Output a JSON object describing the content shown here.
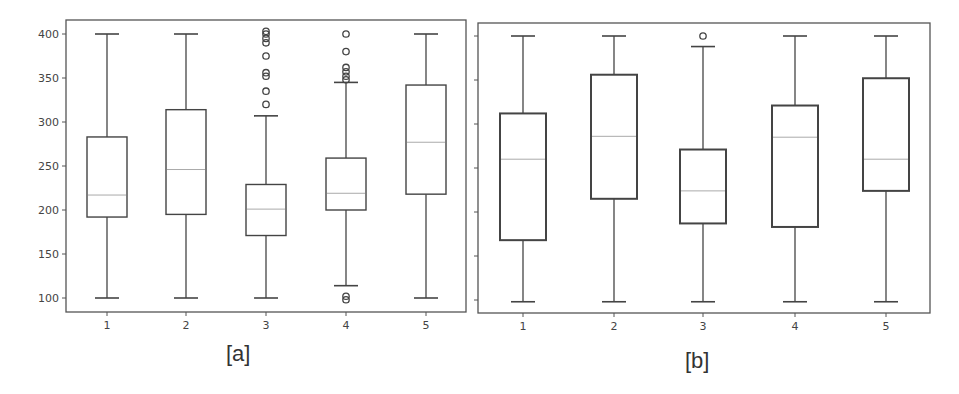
{
  "figure": {
    "panels": [
      {
        "id": "a",
        "label": "[a]"
      },
      {
        "id": "b",
        "label": "[b]"
      }
    ]
  },
  "style": {
    "frame_color": "#555555",
    "box_color": "#444444",
    "median_color": "#aaaaaa",
    "tick_label_color": "#444444"
  },
  "chart_data": [
    {
      "type": "boxplot",
      "title": "",
      "panel_label": "[a]",
      "xlabel": "",
      "ylabel": "",
      "categories": [
        "1",
        "2",
        "3",
        "4",
        "5"
      ],
      "yticks": [
        100,
        150,
        200,
        250,
        300,
        350,
        400
      ],
      "ylim": [
        85,
        415
      ],
      "grid": false,
      "boxes": [
        {
          "q1": 192,
          "median": 217,
          "q3": 283,
          "whisker_low": 100,
          "whisker_high": 400,
          "outliers": []
        },
        {
          "q1": 195,
          "median": 246,
          "q3": 314,
          "whisker_low": 100,
          "whisker_high": 400,
          "outliers": []
        },
        {
          "q1": 171,
          "median": 201,
          "q3": 229,
          "whisker_low": 100,
          "whisker_high": 307,
          "outliers": [
            320,
            335,
            352,
            356,
            375,
            390,
            395,
            400,
            403
          ]
        },
        {
          "q1": 200,
          "median": 219,
          "q3": 259,
          "whisker_low": 114,
          "whisker_high": 345,
          "outliers": [
            98,
            102,
            348,
            352,
            357,
            362,
            380,
            400
          ]
        },
        {
          "q1": 218,
          "median": 277,
          "q3": 342,
          "whisker_low": 100,
          "whisker_high": 400,
          "outliers": []
        }
      ]
    },
    {
      "type": "boxplot",
      "title": "",
      "panel_label": "[b]",
      "xlabel": "",
      "ylabel": "",
      "categories": [
        "1",
        "2",
        "3",
        "4",
        "5"
      ],
      "yticks": [
        100,
        150,
        200,
        250,
        300,
        350,
        400
      ],
      "ytick_labels_visible": false,
      "ylim": [
        85,
        415
      ],
      "grid": false,
      "boxes": [
        {
          "q1": 168,
          "median": 260,
          "q3": 312,
          "whisker_low": 98,
          "whisker_high": 400,
          "outliers": []
        },
        {
          "q1": 215,
          "median": 286,
          "q3": 356,
          "whisker_low": 98,
          "whisker_high": 400,
          "outliers": []
        },
        {
          "q1": 187,
          "median": 224,
          "q3": 271,
          "whisker_low": 98,
          "whisker_high": 388,
          "outliers": [
            400
          ]
        },
        {
          "q1": 183,
          "median": 285,
          "q3": 321,
          "whisker_low": 98,
          "whisker_high": 400,
          "outliers": []
        },
        {
          "q1": 224,
          "median": 260,
          "q3": 352,
          "whisker_low": 98,
          "whisker_high": 400,
          "outliers": []
        }
      ]
    }
  ]
}
